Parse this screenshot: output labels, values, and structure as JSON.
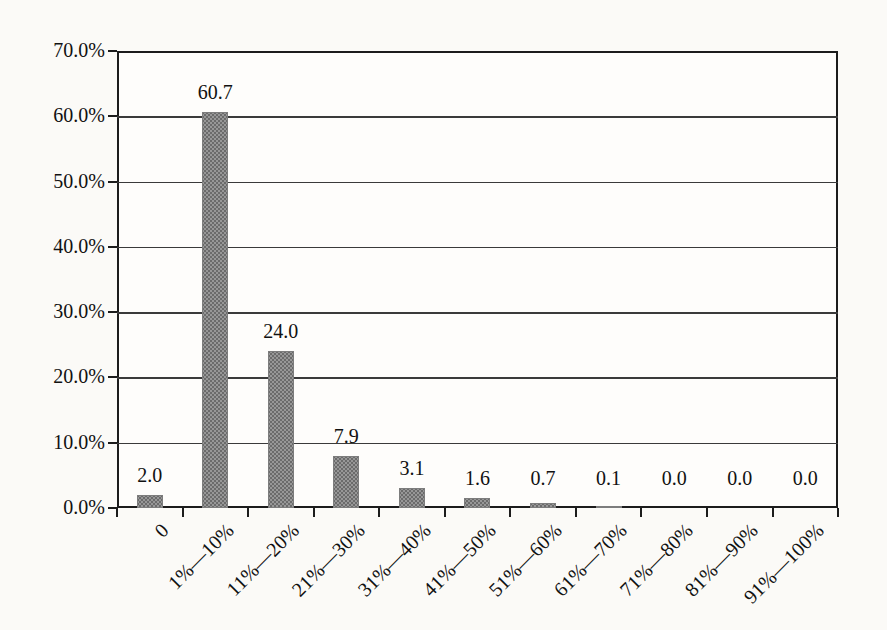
{
  "chart_data": {
    "type": "bar",
    "title": "",
    "xlabel": "",
    "ylabel": "",
    "categories": [
      "0",
      "1%—10%",
      "11%—20%",
      "21%—30%",
      "31%—40%",
      "41%—50%",
      "51%—60%",
      "61%—70%",
      "71%—80%",
      "81%—90%",
      "91%—100%"
    ],
    "values": [
      2.0,
      60.7,
      24.0,
      7.9,
      3.1,
      1.6,
      0.7,
      0.1,
      0.0,
      0.0,
      0.0
    ],
    "value_labels": [
      "2.0",
      "60.7",
      "24.0",
      "7.9",
      "3.1",
      "1.6",
      "0.7",
      "0.1",
      "0.0",
      "0.0",
      "0.0"
    ],
    "y_tick_labels": [
      "70.0%",
      "60.0%",
      "50.0%",
      "40.0%",
      "30.0%",
      "20.0%",
      "10.0%",
      "0.0%"
    ],
    "ylim": [
      0,
      70
    ],
    "y_step": 10,
    "grid": "horizontal",
    "legend": "none",
    "colors": {
      "paper": "#fbfaf7",
      "plot_bg": "#fefdfb",
      "axis": "#1c1c1c",
      "gridline": "#3a3a3a",
      "text": "#111111",
      "bar_fill": "#979797",
      "bar_dot": "#6b6b6b",
      "bar_border": "#7d7d7d"
    }
  }
}
